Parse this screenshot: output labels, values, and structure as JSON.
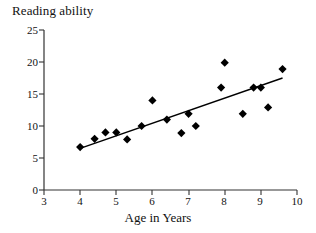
{
  "chart_data": {
    "type": "scatter",
    "title": "Reading ability",
    "xlabel": "Age in Years",
    "ylabel": "",
    "xlim": [
      3,
      10
    ],
    "ylim": [
      0,
      25
    ],
    "xticks": [
      3,
      4,
      5,
      6,
      7,
      8,
      9,
      10
    ],
    "yticks": [
      0,
      5,
      10,
      15,
      20,
      25
    ],
    "grid": false,
    "legend": null,
    "marker": "diamond",
    "marker_color": "#000000",
    "points": [
      {
        "x": 4.0,
        "y": 6.7
      },
      {
        "x": 4.4,
        "y": 8.0
      },
      {
        "x": 4.7,
        "y": 9.0
      },
      {
        "x": 5.0,
        "y": 9.0
      },
      {
        "x": 5.3,
        "y": 7.9
      },
      {
        "x": 5.7,
        "y": 10.0
      },
      {
        "x": 6.0,
        "y": 14.0
      },
      {
        "x": 6.4,
        "y": 11.0
      },
      {
        "x": 6.8,
        "y": 8.9
      },
      {
        "x": 7.0,
        "y": 11.9
      },
      {
        "x": 7.2,
        "y": 10.0
      },
      {
        "x": 7.9,
        "y": 16.0
      },
      {
        "x": 8.0,
        "y": 19.9
      },
      {
        "x": 8.5,
        "y": 11.9
      },
      {
        "x": 8.8,
        "y": 16.0
      },
      {
        "x": 9.0,
        "y": 16.0
      },
      {
        "x": 9.2,
        "y": 12.9
      },
      {
        "x": 9.6,
        "y": 18.9
      }
    ],
    "trendline": {
      "visible": true,
      "color": "#000000",
      "x_start": 4.0,
      "y_start": 6.5,
      "x_end": 9.6,
      "y_end": 17.5
    }
  },
  "axis": {
    "y_tick_labels": [
      "25",
      "20",
      "15",
      "10",
      "5",
      "0"
    ],
    "x_tick_labels": [
      "3",
      "4",
      "5",
      "6",
      "7",
      "8",
      "9",
      "10"
    ]
  },
  "labels": {
    "title": "Reading ability",
    "xlabel": "Age in Years"
  }
}
